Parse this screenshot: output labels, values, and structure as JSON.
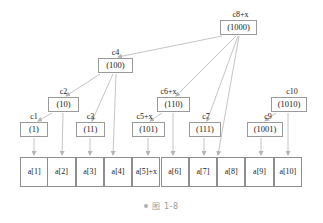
{
  "figure": {
    "caption": "图 1-8",
    "caption_bullet": "bullet-dot",
    "edge_color": "#b5b5b5",
    "box_border_color": "#9a9a9a",
    "text_color": "#1a1a1a"
  },
  "tree_nodes": [
    {
      "id": "c1",
      "label": "c1",
      "value": "(1)",
      "x": 20,
      "y": 122,
      "w": 28,
      "h": 15,
      "label_x": 20,
      "label_y": 112
    },
    {
      "id": "c2",
      "label": "c2",
      "value": "(10)",
      "x": 48,
      "y": 97,
      "w": 31,
      "h": 15,
      "label_x": 48,
      "label_y": 87
    },
    {
      "id": "c3",
      "label": "c3",
      "value": "(11)",
      "x": 76,
      "y": 122,
      "w": 29,
      "h": 15,
      "label_x": 76,
      "label_y": 112
    },
    {
      "id": "c4",
      "label": "c4",
      "value": "(100)",
      "x": 98,
      "y": 58,
      "w": 35,
      "h": 15,
      "label_x": 98,
      "label_y": 48
    },
    {
      "id": "c5",
      "label": "c5+x",
      "value": "(101)",
      "x": 132,
      "y": 122,
      "w": 33,
      "h": 15,
      "label_x": 128,
      "label_y": 112
    },
    {
      "id": "c6",
      "label": "c6+x",
      "value": "(110)",
      "x": 157,
      "y": 97,
      "w": 33,
      "h": 15,
      "label_x": 152,
      "label_y": 87
    },
    {
      "id": "c7",
      "label": "c7",
      "value": "(111)",
      "x": 189,
      "y": 122,
      "w": 32,
      "h": 15,
      "label_x": 190,
      "label_y": 112
    },
    {
      "id": "c8",
      "label": "c8+x",
      "value": "(1000)",
      "x": 220,
      "y": 20,
      "w": 37,
      "h": 15,
      "label_x": 222,
      "label_y": 10
    },
    {
      "id": "c9",
      "label": "c9",
      "value": "(1001)",
      "x": 247,
      "y": 122,
      "w": 36,
      "h": 15,
      "label_x": 250,
      "label_y": 112
    },
    {
      "id": "c10",
      "label": "c10",
      "value": "(1010)",
      "x": 271,
      "y": 97,
      "w": 36,
      "h": 15,
      "label_x": 274,
      "label_y": 87
    }
  ],
  "array": {
    "x": 20,
    "y": 157,
    "cell_width": 28.3,
    "height": 30,
    "cells": [
      {
        "text": "a[1]",
        "wrap": false
      },
      {
        "text": "a[2]",
        "wrap": false
      },
      {
        "text": "a[3]",
        "wrap": false
      },
      {
        "text": "a[4]",
        "wrap": false
      },
      {
        "text": "a[5]+x",
        "wrap": true
      },
      {
        "text": "a[6]",
        "wrap": false
      },
      {
        "text": "a[7]",
        "wrap": false
      },
      {
        "text": "a[8]",
        "wrap": false
      },
      {
        "text": "a[9]",
        "wrap": false
      },
      {
        "text": "a[10]",
        "wrap": false
      }
    ]
  },
  "edges": [
    {
      "from": "c8",
      "to": "c4",
      "x1": 222,
      "y1": 36,
      "x2": 118,
      "y2": 57
    },
    {
      "from": "c8",
      "to": "c6",
      "x1": 236,
      "y1": 36,
      "x2": 176,
      "y2": 96
    },
    {
      "from": "c8",
      "to": "c7",
      "x1": 238,
      "y1": 36,
      "x2": 207,
      "y2": 121
    },
    {
      "from": "c8",
      "to": "a8",
      "x1": 239,
      "y1": 36,
      "x2": 218,
      "y2": 155
    },
    {
      "from": "c4",
      "to": "c2",
      "x1": 100,
      "y1": 74,
      "x2": 66,
      "y2": 96
    },
    {
      "from": "c4",
      "to": "c3",
      "x1": 113,
      "y1": 74,
      "x2": 92,
      "y2": 121
    },
    {
      "from": "c4",
      "to": "a4",
      "x1": 116,
      "y1": 74,
      "x2": 113,
      "y2": 155
    },
    {
      "from": "c2",
      "to": "c1",
      "x1": 52,
      "y1": 113,
      "x2": 38,
      "y2": 121
    },
    {
      "from": "c2",
      "to": "a2",
      "x1": 63,
      "y1": 113,
      "x2": 62,
      "y2": 155
    },
    {
      "from": "c1",
      "to": "a1",
      "x1": 34,
      "y1": 138,
      "x2": 34,
      "y2": 155
    },
    {
      "from": "c3",
      "to": "a3",
      "x1": 90,
      "y1": 138,
      "x2": 90,
      "y2": 155
    },
    {
      "from": "c6",
      "to": "c5",
      "x1": 162,
      "y1": 113,
      "x2": 150,
      "y2": 121
    },
    {
      "from": "c6",
      "to": "a6",
      "x1": 173,
      "y1": 113,
      "x2": 173,
      "y2": 155
    },
    {
      "from": "c5",
      "to": "a5",
      "x1": 148,
      "y1": 138,
      "x2": 148,
      "y2": 155
    },
    {
      "from": "c7",
      "to": "a7",
      "x1": 204,
      "y1": 138,
      "x2": 204,
      "y2": 155
    },
    {
      "from": "c10",
      "to": "c9",
      "x1": 276,
      "y1": 113,
      "x2": 265,
      "y2": 121
    },
    {
      "from": "c10",
      "to": "a10",
      "x1": 288,
      "y1": 113,
      "x2": 288,
      "y2": 155
    },
    {
      "from": "c9",
      "to": "a9",
      "x1": 261,
      "y1": 138,
      "x2": 261,
      "y2": 155
    }
  ]
}
